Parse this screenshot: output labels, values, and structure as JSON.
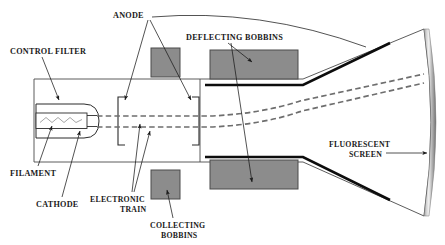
{
  "diagram": {
    "type": "technical-cross-section",
    "colors": {
      "outline": "#3a3a3a",
      "bobbin_fill": "#8c8c8c",
      "bobbin_stroke": "#4a4a4a",
      "beam": "#6e6e6e",
      "electrode_edge": "#111111",
      "screen_band": "#b5b5b5",
      "label_text": "#1a1a1a"
    },
    "labels": {
      "control_filter": "CONTROL FILTER",
      "filament": "FILAMENT",
      "cathode": "CATHODE",
      "anode": "ANODE",
      "electronic_train_line1": "ELECTRONIC",
      "electronic_train_line2": "TRAIN",
      "deflecting_bobbins": "DEFLECTING BOBBINS",
      "collecting_bobbins_line1": "COLLECTING",
      "collecting_bobbins_line2": "BOBBINS",
      "fluorescent_screen_line1": "FLUORESCENT",
      "fluorescent_screen_line2": "SCREEN"
    },
    "components": [
      {
        "name": "control-filter",
        "label": "CONTROL FILTER",
        "kind": "electrode-housing"
      },
      {
        "name": "filament",
        "label": "FILAMENT",
        "kind": "heater-coil"
      },
      {
        "name": "cathode",
        "label": "CATHODE",
        "kind": "electron-emitter"
      },
      {
        "name": "anode",
        "label": "ANODE",
        "kind": "accelerating-electrode",
        "count": 2
      },
      {
        "name": "electronic-train",
        "label": "ELECTRONIC TRAIN",
        "kind": "electron-beam"
      },
      {
        "name": "collecting-bobbins",
        "label": "COLLECTING BOBBINS",
        "kind": "coil",
        "count": 2
      },
      {
        "name": "deflecting-bobbins",
        "label": "DEFLECTING BOBBINS",
        "kind": "coil",
        "count": 2
      },
      {
        "name": "fluorescent-screen",
        "label": "FLUORESCENT SCREEN",
        "kind": "phosphor-screen"
      }
    ]
  }
}
